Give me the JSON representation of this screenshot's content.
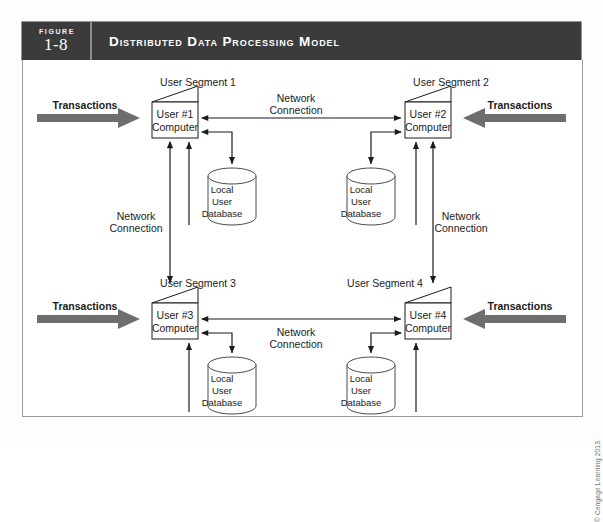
{
  "figure": {
    "label_word": "FIGURE",
    "number": "1-8",
    "title": "Distributed Data Processing Model"
  },
  "colors": {
    "header_bg": "#3b3b3b",
    "header_text": "#ffffff",
    "arrow_gray": "#6e6e6e",
    "line_black": "#1b1b1b",
    "frame_border": "#9a9a9a"
  },
  "diagram": {
    "segments": [
      {
        "id": "seg1",
        "label": "User Segment 1"
      },
      {
        "id": "seg2",
        "label": "User Segment 2"
      },
      {
        "id": "seg3",
        "label": "User Segment 3"
      },
      {
        "id": "seg4",
        "label": "User Segment 4"
      }
    ],
    "computers": [
      {
        "id": "computer1",
        "line1": "User #1",
        "line2": "Computer"
      },
      {
        "id": "computer2",
        "line1": "User #2",
        "line2": "Computer"
      },
      {
        "id": "computer3",
        "line1": "User #3",
        "line2": "Computer"
      },
      {
        "id": "computer4",
        "line1": "User #4",
        "line2": "Computer"
      }
    ],
    "databases": [
      {
        "id": "db1",
        "line1": "Local",
        "line2": "User",
        "line3": "Database"
      },
      {
        "id": "db2",
        "line1": "Local",
        "line2": "User",
        "line3": "Database"
      },
      {
        "id": "db3",
        "line1": "Local",
        "line2": "User",
        "line3": "Database"
      },
      {
        "id": "db4",
        "line1": "Local",
        "line2": "User",
        "line3": "Database"
      }
    ],
    "transactions": [
      {
        "id": "trans1",
        "label": "Transactions",
        "direction": "right"
      },
      {
        "id": "trans2",
        "label": "Transactions",
        "direction": "left"
      },
      {
        "id": "trans3",
        "label": "Transactions",
        "direction": "right"
      },
      {
        "id": "trans4",
        "label": "Transactions",
        "direction": "left"
      }
    ],
    "network_connections": [
      {
        "id": "net_top",
        "line1": "Network",
        "line2": "Connection"
      },
      {
        "id": "net_left",
        "line1": "Network",
        "line2": "Connection"
      },
      {
        "id": "net_right",
        "line1": "Network",
        "line2": "Connection"
      },
      {
        "id": "net_bottom",
        "line1": "Network",
        "line2": "Connection"
      }
    ]
  },
  "footer": {
    "copyright": "© Cengage Learning 2013."
  }
}
